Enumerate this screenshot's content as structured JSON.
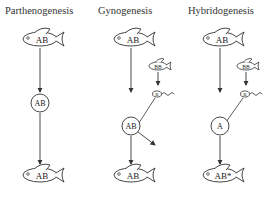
{
  "columns": [
    {
      "title": "Parthenogenesis",
      "mother_fish": "AB",
      "egg": "AB",
      "offspring_fish": "AB"
    },
    {
      "title": "Gynogenesis",
      "mother_fish": "AB",
      "father_fish": "BB",
      "sperm": "B",
      "egg": "AB",
      "offspring_fish": "AB"
    },
    {
      "title": "Hybridogenesis",
      "mother_fish": "AB",
      "father_fish": "BB",
      "sperm": "B",
      "egg": "A",
      "offspring_fish": "AB*"
    }
  ],
  "colors": {
    "line": "#333333",
    "background": "#ffffff"
  }
}
